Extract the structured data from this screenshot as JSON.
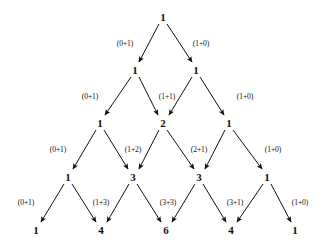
{
  "diagram": {
    "type": "tree-diagram",
    "background_color": "#ffffff",
    "ink_color": "#111111",
    "rows": [
      {
        "index": 0,
        "y": 17,
        "nodes": [
          {
            "label": "1",
            "x": 163
          }
        ]
      },
      {
        "index": 1,
        "y": 70,
        "nodes": [
          {
            "label": "1",
            "x": 135
          },
          {
            "label": "1",
            "x": 196
          }
        ]
      },
      {
        "index": 2,
        "y": 123,
        "nodes": [
          {
            "label": "1",
            "x": 100
          },
          {
            "label": "2",
            "x": 163
          },
          {
            "label": "1",
            "x": 229
          }
        ]
      },
      {
        "index": 3,
        "y": 177,
        "nodes": [
          {
            "label": "1",
            "x": 68
          },
          {
            "label": "3",
            "x": 133
          },
          {
            "label": "3",
            "x": 199
          },
          {
            "label": "1",
            "x": 267
          }
        ]
      },
      {
        "index": 4,
        "y": 230,
        "nodes": [
          {
            "label": "1",
            "x": 36
          },
          {
            "label": "4",
            "x": 101
          },
          {
            "label": "6",
            "x": 166
          },
          {
            "label": "4",
            "x": 231
          },
          {
            "label": "1",
            "x": 295
          }
        ]
      }
    ],
    "edge_labels": [
      {
        "text": "(0+1)",
        "x": 125,
        "y": 44
      },
      {
        "text": "(1+0)",
        "x": 201,
        "y": 44
      },
      {
        "text": "(0+1)",
        "x": 90,
        "y": 97
      },
      {
        "text": "(1+1)",
        "x": 167,
        "y": 97
      },
      {
        "text": "(1+0)",
        "x": 245,
        "y": 97
      },
      {
        "text": "(0+1)",
        "x": 58,
        "y": 150
      },
      {
        "text": "(1+2)",
        "x": 133,
        "y": 150
      },
      {
        "text": "(2+1)",
        "x": 199,
        "y": 150
      },
      {
        "text": "(1+0)",
        "x": 273,
        "y": 150
      },
      {
        "text": "(0+1)",
        "x": 26,
        "y": 203
      },
      {
        "text": "(1+3)",
        "x": 101,
        "y": 203
      },
      {
        "text": "(3+3)",
        "x": 168,
        "y": 203
      },
      {
        "text": "(3+1)",
        "x": 235,
        "y": 203
      },
      {
        "text": "(1+0)",
        "x": 300,
        "y": 203
      }
    ],
    "arrows": [
      {
        "x1": 159,
        "y1": 24,
        "x2": 139,
        "y2": 62
      },
      {
        "x1": 167,
        "y1": 24,
        "x2": 192,
        "y2": 62
      },
      {
        "x1": 131,
        "y1": 77,
        "x2": 105,
        "y2": 115
      },
      {
        "x1": 139,
        "y1": 77,
        "x2": 158,
        "y2": 115
      },
      {
        "x1": 192,
        "y1": 77,
        "x2": 169,
        "y2": 115
      },
      {
        "x1": 200,
        "y1": 77,
        "x2": 224,
        "y2": 115
      },
      {
        "x1": 96,
        "y1": 130,
        "x2": 73,
        "y2": 169
      },
      {
        "x1": 104,
        "y1": 130,
        "x2": 128,
        "y2": 169
      },
      {
        "x1": 159,
        "y1": 130,
        "x2": 139,
        "y2": 169
      },
      {
        "x1": 167,
        "y1": 130,
        "x2": 194,
        "y2": 169
      },
      {
        "x1": 225,
        "y1": 130,
        "x2": 205,
        "y2": 169
      },
      {
        "x1": 233,
        "y1": 130,
        "x2": 262,
        "y2": 169
      },
      {
        "x1": 64,
        "y1": 184,
        "x2": 41,
        "y2": 222
      },
      {
        "x1": 72,
        "y1": 184,
        "x2": 96,
        "y2": 222
      },
      {
        "x1": 129,
        "y1": 184,
        "x2": 107,
        "y2": 222
      },
      {
        "x1": 137,
        "y1": 184,
        "x2": 161,
        "y2": 222
      },
      {
        "x1": 195,
        "y1": 184,
        "x2": 172,
        "y2": 222
      },
      {
        "x1": 203,
        "y1": 184,
        "x2": 226,
        "y2": 222
      },
      {
        "x1": 263,
        "y1": 184,
        "x2": 237,
        "y2": 222
      },
      {
        "x1": 271,
        "y1": 184,
        "x2": 291,
        "y2": 222
      }
    ]
  }
}
